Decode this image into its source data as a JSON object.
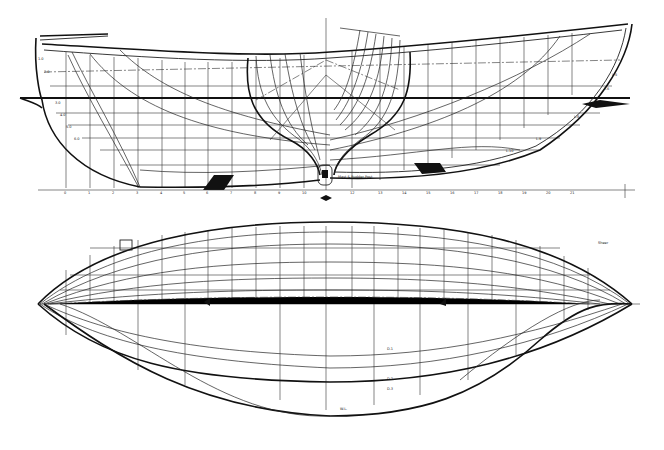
{
  "drawing": {
    "title": "Lines plan",
    "views": [
      "profile-and-body-plan",
      "half-breadth-plan"
    ],
    "profile": {
      "station_labels": [
        "0",
        "1",
        "2",
        "3",
        "4",
        "5",
        "6",
        "7",
        "8",
        "9",
        "10",
        "11",
        "12",
        "13",
        "14",
        "15",
        "16",
        "17",
        "18",
        "19",
        "20",
        "21",
        "22",
        "23",
        "24",
        "25"
      ],
      "buttock_labels_aft": [
        "1.0",
        "2.0",
        "3.0",
        "4.0",
        "5.0",
        "6.0"
      ],
      "buttock_labels_fwd": [
        "L.5",
        "L.6",
        "L.7",
        "L.8",
        "L.9",
        "L.10"
      ],
      "note_text": "Mast & Rudder Post"
    },
    "half_breadth": {
      "labels": [
        "W.L.",
        "D.1",
        "D.2",
        "D.3",
        "Sheer"
      ]
    },
    "colors": {
      "ink": "#111111",
      "paper": "#ffffff"
    }
  }
}
